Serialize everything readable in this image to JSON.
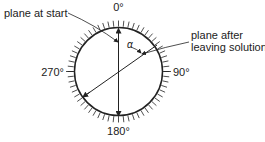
{
  "labels": {
    "top": "0°",
    "right": "90°",
    "bottom": "180°",
    "left": "270°",
    "plane_start": "plane at start",
    "plane_after_1": "plane after",
    "plane_after_2": "leaving solution",
    "angle": "α"
  },
  "colors": {
    "stroke": "#222222",
    "background": "#ffffff"
  }
}
